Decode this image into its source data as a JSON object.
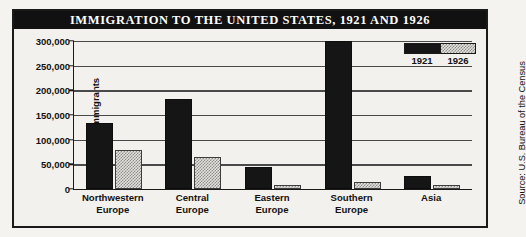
{
  "figure": {
    "title": "IMMIGRATION TO THE UNITED STATES, 1921 AND 1926",
    "source": "Source: U.S. Bureau of the Census"
  },
  "legend": {
    "entries": [
      {
        "label": "1921",
        "swatch": "solid-black"
      },
      {
        "label": "1926",
        "swatch": "stippled-gray"
      }
    ]
  },
  "chart_data": {
    "type": "bar",
    "title": "IMMIGRATION TO THE UNITED STATES, 1921 AND 1926",
    "xlabel": "",
    "ylabel": "Number of Immigrants",
    "categories": [
      "Northwestern Europe",
      "Central Europe",
      "Eastern Europe",
      "Southern Europe",
      "Asia"
    ],
    "series": [
      {
        "name": "1921",
        "color": "#151515",
        "values": [
          130000,
          178000,
          40000,
          295000,
          22000
        ]
      },
      {
        "name": "1926",
        "color": "#d9d8d4",
        "values": [
          75000,
          60000,
          3000,
          10000,
          1500
        ]
      }
    ],
    "ylim": [
      0,
      300000
    ],
    "yticks": [
      0,
      50000,
      100000,
      150000,
      200000,
      250000,
      300000
    ],
    "ytick_labels": [
      "0",
      "50,000",
      "100,000",
      "150,000",
      "200,000",
      "250,000",
      "300,000"
    ],
    "grid": true,
    "legend_position": "top-right"
  }
}
